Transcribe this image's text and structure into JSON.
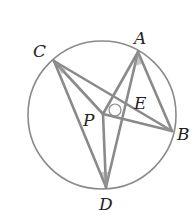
{
  "figure": {
    "type": "geometry",
    "colors": {
      "stroke": "#8a8a8a",
      "label": "#222222",
      "background": "#ffffff"
    },
    "circle": {
      "cx": 102,
      "cy": 115,
      "r": 74
    },
    "points": {
      "A": {
        "x": 138,
        "y": 52,
        "label": "A",
        "lx": 134,
        "ly": 44
      },
      "B": {
        "x": 172,
        "y": 131,
        "label": "B",
        "lx": 177,
        "ly": 140
      },
      "C": {
        "x": 54,
        "y": 61,
        "label": "C",
        "lx": 33,
        "ly": 57
      },
      "D": {
        "x": 106,
        "y": 187,
        "label": "D",
        "lx": 99,
        "ly": 210
      },
      "P": {
        "x": 103,
        "y": 114,
        "label": "P",
        "lx": 83,
        "ly": 126
      },
      "E": {
        "x": 127,
        "y": 106,
        "label": "E",
        "lx": 134,
        "ly": 109
      }
    },
    "segments": [
      [
        "C",
        "B"
      ],
      [
        "C",
        "D"
      ],
      [
        "C",
        "P"
      ],
      [
        "A",
        "P"
      ],
      [
        "A",
        "B"
      ],
      [
        "A",
        "D"
      ],
      [
        "P",
        "B"
      ],
      [
        "P",
        "D"
      ]
    ],
    "labels": [
      "A",
      "B",
      "C",
      "D",
      "P",
      "E"
    ]
  }
}
